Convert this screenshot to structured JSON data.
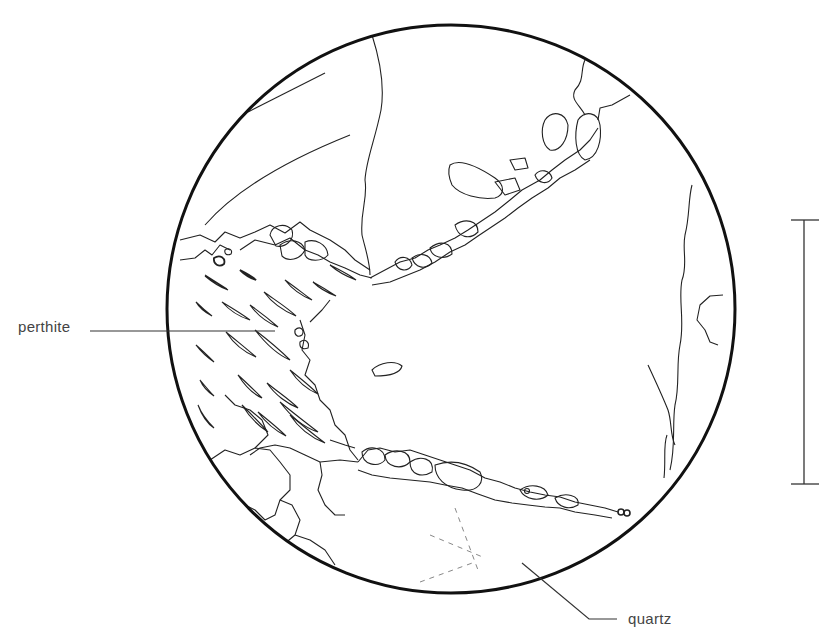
{
  "figure": {
    "type": "petrographic thin-section sketch (field of view)",
    "labels": {
      "perthite": "perthite",
      "quartz": "quartz"
    },
    "colors": {
      "line": "#222222",
      "outline": "#111111",
      "background": "#ffffff",
      "dashed": "#888888"
    },
    "field_of_view": {
      "cx": 451,
      "cy": 309,
      "r": 284
    },
    "scale_bar": {
      "x": 804,
      "y_top": 220,
      "y_bottom": 484,
      "label": ""
    }
  }
}
